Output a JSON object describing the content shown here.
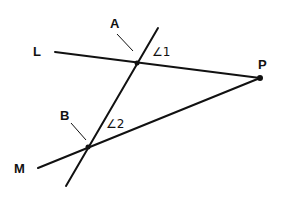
{
  "diagram": {
    "type": "geometry",
    "stroke_color": "#111111",
    "background": "#ffffff",
    "labels": {
      "line_l": "L",
      "line_m": "M",
      "point_a": "A",
      "point_b": "B",
      "point_p": "P",
      "angle_1": "∠1",
      "angle_2": "∠2"
    },
    "points": {
      "A": [
        137,
        63
      ],
      "B": [
        88,
        147
      ],
      "P": [
        260,
        78
      ]
    },
    "lines": {
      "L": {
        "from": [
          55,
          52
        ],
        "to": [
          260,
          78
        ]
      },
      "M": {
        "from": [
          38,
          168
        ],
        "to": [
          260,
          78
        ]
      },
      "transversal": {
        "from": [
          158,
          28
        ],
        "to": [
          66,
          186
        ]
      }
    }
  }
}
